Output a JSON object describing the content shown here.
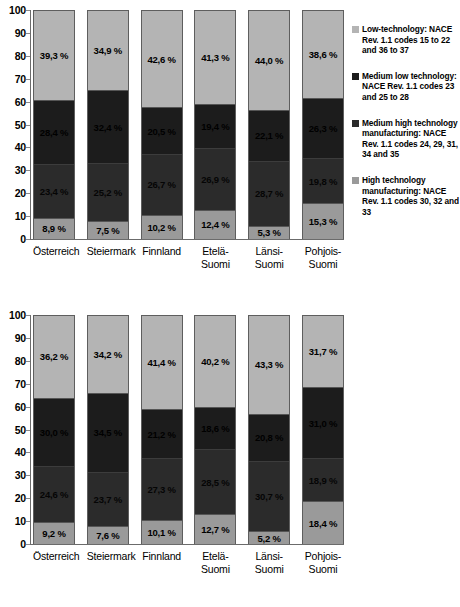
{
  "axis": {
    "ticks": [
      "100",
      "90",
      "80",
      "70",
      "60",
      "50",
      "40",
      "30",
      "20",
      "10",
      "0"
    ],
    "ylim": [
      0,
      100
    ]
  },
  "legend": {
    "items": [
      {
        "name": "low-technology",
        "color": "#b4b4b4",
        "label": "Low-technology: NACE Rev. 1.1 codes 15 to 22 and 36 to 37"
      },
      {
        "name": "medium-low-technology",
        "color": "#1c1c1c",
        "label": "Medium low technology: NACE Rev. 1.1 codes 23 and 25 to 28"
      },
      {
        "name": "medium-high-technology",
        "color": "#2b2b2b",
        "label": "Medium high technology manufacturing: NACE Rev. 1.1 codes 24, 29, 31, 34 and 35"
      },
      {
        "name": "high-technology",
        "color": "#9a9a9a",
        "label": "High technology manufacturing: NACE Rev. 1.1 codes 30, 32 and 33"
      }
    ]
  },
  "chart_data": [
    {
      "type": "bar",
      "stacked": true,
      "title": "",
      "xlabel": "",
      "ylabel": "",
      "ylim": [
        0,
        100
      ],
      "grid": false,
      "legend_position": "right",
      "categories": [
        "Österreich",
        "Steiermark",
        "Finnland",
        "Etelä-Suomi",
        "Länsi-Suomi",
        "Pohjois-Suomi"
      ],
      "series": [
        {
          "name": "High technology manufacturing: NACE Rev. 1.1 codes 30, 32 and 33",
          "values": [
            8.9,
            7.5,
            10.2,
            12.4,
            5.3,
            15.3
          ],
          "labels": [
            "8,9 %",
            "7,5 %",
            "10,2 %",
            "12,4 %",
            "5,3 %",
            "15,3 %"
          ]
        },
        {
          "name": "Medium high technology manufacturing: NACE Rev. 1.1 codes 24, 29, 31, 34 and 35",
          "values": [
            23.4,
            25.2,
            26.7,
            26.9,
            28.7,
            19.8
          ],
          "labels": [
            "23,4 %",
            "25,2 %",
            "26,7 %",
            "26,9 %",
            "28,7 %",
            "19,8 %"
          ]
        },
        {
          "name": "Medium low technology: NACE Rev. 1.1 codes 23 and 25 to 28",
          "values": [
            28.4,
            32.4,
            20.5,
            19.4,
            22.1,
            26.3
          ],
          "labels": [
            "28,4 %",
            "32,4 %",
            "20,5 %",
            "19,4 %",
            "22,1 %",
            "26,3 %"
          ]
        },
        {
          "name": "Low-technology: NACE Rev. 1.1 codes 15 to 22 and 36 to 37",
          "values": [
            39.3,
            34.9,
            42.6,
            41.3,
            44.0,
            38.6
          ],
          "labels": [
            "39,3 %",
            "34,9 %",
            "42,6 %",
            "41,3 %",
            "44,0 %",
            "38,6 %"
          ]
        }
      ]
    },
    {
      "type": "bar",
      "stacked": true,
      "title": "",
      "xlabel": "",
      "ylabel": "",
      "ylim": [
        0,
        100
      ],
      "grid": false,
      "legend_position": "right",
      "categories": [
        "Österreich",
        "Steiermark",
        "Finnland",
        "Etelä-Suomi",
        "Länsi-Suomi",
        "Pohjois-Suomi"
      ],
      "series": [
        {
          "name": "High technology manufacturing: NACE Rev. 1.1 codes 30, 32 and 33",
          "values": [
            9.2,
            7.6,
            10.1,
            12.7,
            5.2,
            18.4
          ],
          "labels": [
            "9,2 %",
            "7,6 %",
            "10,1 %",
            "12,7 %",
            "5,2 %",
            "18,4 %"
          ]
        },
        {
          "name": "Medium high technology manufacturing: NACE Rev. 1.1 codes 24, 29, 31, 34 and 35",
          "values": [
            24.6,
            23.7,
            27.3,
            28.5,
            30.7,
            18.9
          ],
          "labels": [
            "24,6 %",
            "23,7 %",
            "27,3 %",
            "28,5 %",
            "30,7 %",
            "18,9 %"
          ]
        },
        {
          "name": "Medium low technology: NACE Rev. 1.1 codes 23 and 25 to 28",
          "values": [
            30.0,
            34.5,
            21.2,
            18.6,
            20.8,
            31.0
          ],
          "labels": [
            "30,0 %",
            "34,5 %",
            "21,2 %",
            "18,6 %",
            "20,8 %",
            "31,0 %"
          ]
        },
        {
          "name": "Low-technology: NACE Rev. 1.1 codes 15 to 22 and 36 to 37",
          "values": [
            36.2,
            34.2,
            41.4,
            40.2,
            43.3,
            31.7
          ],
          "labels": [
            "36,2 %",
            "34,2 %",
            "41,4 %",
            "40,2 %",
            "43,3 %",
            "31,7 %"
          ]
        }
      ]
    }
  ]
}
